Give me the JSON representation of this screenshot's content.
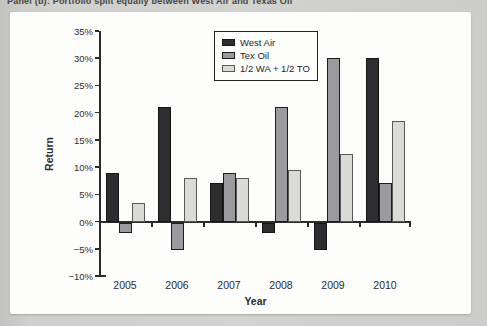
{
  "page": {
    "title": "Panel (b): Portfolio split equally between West Air and Texas Oil"
  },
  "chart_data": {
    "type": "bar",
    "title": "",
    "xlabel": "Year",
    "ylabel": "Return",
    "categories": [
      "2005",
      "2006",
      "2007",
      "2008",
      "2009",
      "2010"
    ],
    "series": [
      {
        "name": "West Air",
        "fill": "#2e2e30",
        "stroke": "#141414",
        "values": [
          9,
          21,
          7,
          -2,
          -5,
          30
        ]
      },
      {
        "name": "Tex Oil",
        "fill": "#9b9b9f",
        "stroke": "#1c1c1c",
        "values": [
          -2,
          -5,
          9,
          21,
          30,
          7
        ]
      },
      {
        "name": "1/2 WA + 1/2 TO",
        "fill": "#dadad6",
        "stroke": "#59595b",
        "values": [
          3.5,
          8,
          8,
          9.5,
          12.5,
          18.5
        ]
      }
    ],
    "ylim": [
      -10,
      35
    ],
    "ytick_step": 5,
    "ytick_labels": [
      "35%",
      "30%",
      "25%",
      "20%",
      "15%",
      "10%",
      "5%",
      "0%",
      "−5%",
      "−10%"
    ],
    "grid": false,
    "legend_position": "top-center-inside"
  }
}
